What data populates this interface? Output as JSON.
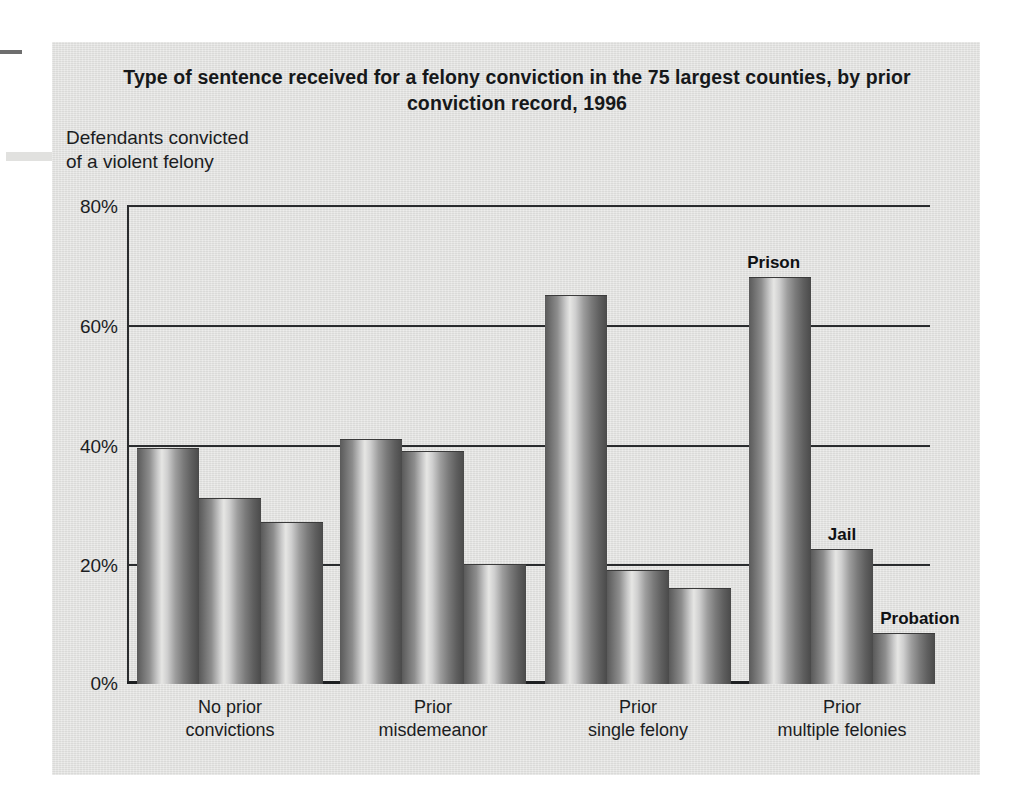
{
  "figure": {
    "title": "Type of sentence received for a felony conviction in the 75 largest counties, by prior conviction record, 1996",
    "y_axis_caption": "Defendants convicted\nof a violent felony",
    "y_axis_caption_line1": "Defendants convicted",
    "y_axis_caption_line2": "of a violent felony"
  },
  "chart_data": {
    "type": "bar",
    "title": "Type of sentence received for a felony conviction in the 75 largest counties, by prior conviction record, 1996",
    "subtitle": "Defendants convicted of a violent felony",
    "xlabel": "",
    "ylabel": "",
    "ylim": [
      0,
      80
    ],
    "yticks": [
      0,
      20,
      40,
      60,
      80
    ],
    "ytick_labels": [
      "0%",
      "20%",
      "40%",
      "60%",
      "80%"
    ],
    "grid": true,
    "legend_position": "data-labels-on-last-group",
    "categories": [
      "No prior\nconvictions",
      "Prior\nmisdemeanor",
      "Prior\nsingle felony",
      "Prior\nmultiple felonies"
    ],
    "category_lines": [
      [
        "No prior",
        "convictions"
      ],
      [
        "Prior",
        "misdemeanor"
      ],
      [
        "Prior",
        "single felony"
      ],
      [
        "Prior",
        "multiple felonies"
      ]
    ],
    "series": [
      {
        "name": "Prison",
        "values": [
          39.5,
          41,
          65,
          68
        ]
      },
      {
        "name": "Jail",
        "values": [
          31,
          39,
          19,
          22.5
        ]
      },
      {
        "name": "Probation",
        "values": [
          27,
          20,
          16,
          8.5
        ]
      }
    ],
    "annotations": [
      {
        "text": "Prison",
        "group": "Prior multiple felonies",
        "series": "Prison"
      },
      {
        "text": "Jail",
        "group": "Prior multiple felonies",
        "series": "Jail"
      },
      {
        "text": "Probation",
        "group": "Prior multiple felonies",
        "series": "Probation"
      }
    ],
    "colors": {
      "bar_dark": "#5a5a5a",
      "bar_highlight": "#e6e6e4",
      "axis": "#2a2c2e",
      "panel_background": "#e2e2e0",
      "text": "#1b1d1f"
    }
  }
}
